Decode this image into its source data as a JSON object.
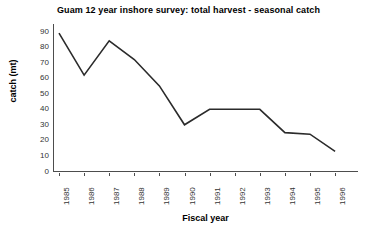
{
  "chart_data": {
    "type": "line",
    "title": "Guam 12 year inshore survey: total harvest - seasonal catch",
    "xlabel": "Fiscal year",
    "ylabel": "catch (mt)",
    "categories": [
      "1985",
      "1986",
      "1987",
      "1988",
      "1989",
      "1990",
      "1991",
      "1992",
      "1993",
      "1994",
      "1995",
      "1996"
    ],
    "values": [
      89,
      62,
      84,
      72,
      55,
      30,
      40,
      40,
      40,
      25,
      24,
      13
    ],
    "series": [
      {
        "name": "total harvest - seasonal catch",
        "values": [
          89,
          62,
          84,
          72,
          55,
          30,
          40,
          40,
          40,
          25,
          24,
          13
        ]
      }
    ],
    "ylim": [
      0,
      90
    ],
    "y_ticks": [
      "0",
      "10",
      "20",
      "30",
      "40",
      "50",
      "60",
      "70",
      "80",
      "90"
    ],
    "grid": false,
    "legend": "none",
    "line_color": "#2b2b2b"
  }
}
